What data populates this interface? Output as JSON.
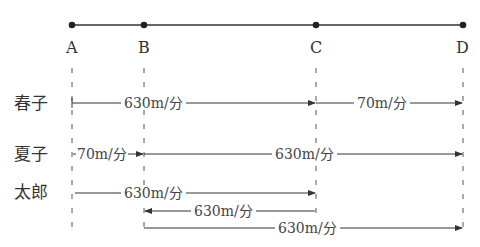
{
  "points": {
    "A": "A",
    "B": "B",
    "C": "C",
    "D": "D"
  },
  "people": {
    "haruko": {
      "name": "春子",
      "legs": [
        {
          "from": "A",
          "to": "C",
          "speed": "630m/分"
        },
        {
          "from": "C",
          "to": "D",
          "speed": "70m/分"
        }
      ]
    },
    "natsuko": {
      "name": "夏子",
      "legs": [
        {
          "from": "A",
          "to": "B",
          "speed": "70m/分"
        },
        {
          "from": "B",
          "to": "D",
          "speed": "630m/分"
        }
      ]
    },
    "taro": {
      "name": "太郎",
      "legs": [
        {
          "from": "A",
          "to": "C",
          "speed": "630m/分"
        },
        {
          "from": "C",
          "to": "B",
          "speed": "630m/分"
        },
        {
          "from": "B",
          "to": "D",
          "speed": "630m/分"
        }
      ]
    }
  },
  "colors": {
    "line": "#333333",
    "dashed": "#555555",
    "background": "#ffffff"
  }
}
